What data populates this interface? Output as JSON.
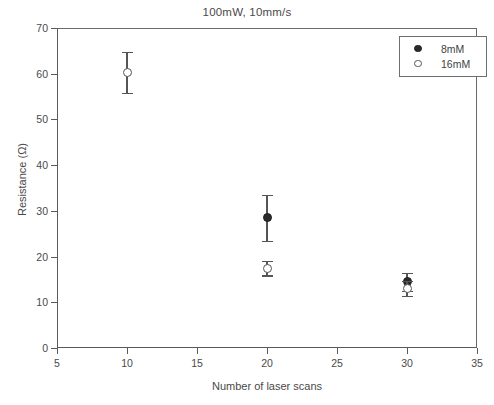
{
  "chart_data": {
    "type": "scatter",
    "title": "100mW, 10mm/s",
    "xlabel": "Number of laser scans",
    "ylabel": "Resistance (Ω)",
    "xlim": [
      5,
      35
    ],
    "ylim": [
      0,
      70
    ],
    "xticks": [
      5,
      10,
      15,
      20,
      25,
      30,
      35
    ],
    "yticks": [
      0,
      10,
      20,
      30,
      40,
      50,
      60,
      70
    ],
    "xtick_labels": [
      "5",
      "10",
      "15",
      "20",
      "25",
      "30",
      "35"
    ],
    "ytick_labels": [
      "0",
      "10",
      "20",
      "30",
      "40",
      "50",
      "60",
      "70"
    ],
    "grid": false,
    "legend_position": "top-right",
    "error_bars": "symmetric-y",
    "series": [
      {
        "name": "8mM",
        "marker": "filled-circle",
        "color": "#2a2a2a",
        "points": [
          {
            "x": 20,
            "y": 28.5,
            "yerr": 5.0
          },
          {
            "x": 30,
            "y": 14.5,
            "yerr": 2.0
          }
        ]
      },
      {
        "name": "16mM",
        "marker": "open-circle",
        "color": "#555555",
        "points": [
          {
            "x": 10,
            "y": 60.3,
            "yerr": 4.5
          },
          {
            "x": 20,
            "y": 17.5,
            "yerr": 1.6
          },
          {
            "x": 30,
            "y": 13.0,
            "yerr": 1.6
          }
        ]
      }
    ]
  },
  "legend": {
    "entries": [
      {
        "label": "8mM",
        "marker": "filled-circle"
      },
      {
        "label": "16mM",
        "marker": "open-circle"
      }
    ]
  }
}
